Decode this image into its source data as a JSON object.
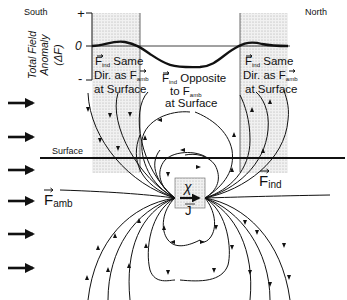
{
  "labels": {
    "south": "South",
    "north": "North",
    "y_axis_title_1": "Total Field",
    "y_axis_title_2": "Anomaly",
    "y_axis_title_3": "(ΔF)",
    "tick_plus": "+",
    "tick_zero": "0",
    "tick_minus": "-",
    "left_region_1": "F",
    "left_region_1_sub": "ind",
    "left_region_1_rest": " Same",
    "left_region_2": "Dir. as F",
    "left_region_2_sub": "amb",
    "left_region_3": "at Surface",
    "center_region_1": "F",
    "center_region_1_sub": "ind",
    "center_region_1_rest": " Opposite",
    "center_region_2": "to F",
    "center_region_2_sub": "amb",
    "center_region_3": "at Surface",
    "right_region_1": "F",
    "right_region_1_sub": "ind",
    "right_region_1_rest": " Same",
    "right_region_2": "Dir. as F",
    "right_region_2_sub": "amb",
    "right_region_3": "at Surface",
    "surface": "Surface",
    "f_amb": "F",
    "f_amb_sub": "amb",
    "f_ind": "F",
    "f_ind_sub": "ind",
    "chi": "χ",
    "j": "J"
  },
  "colors": {
    "ink": "#111111",
    "shading": "#d9d9d9",
    "background": "#ffffff"
  },
  "ambient_arrows_count": 6
}
